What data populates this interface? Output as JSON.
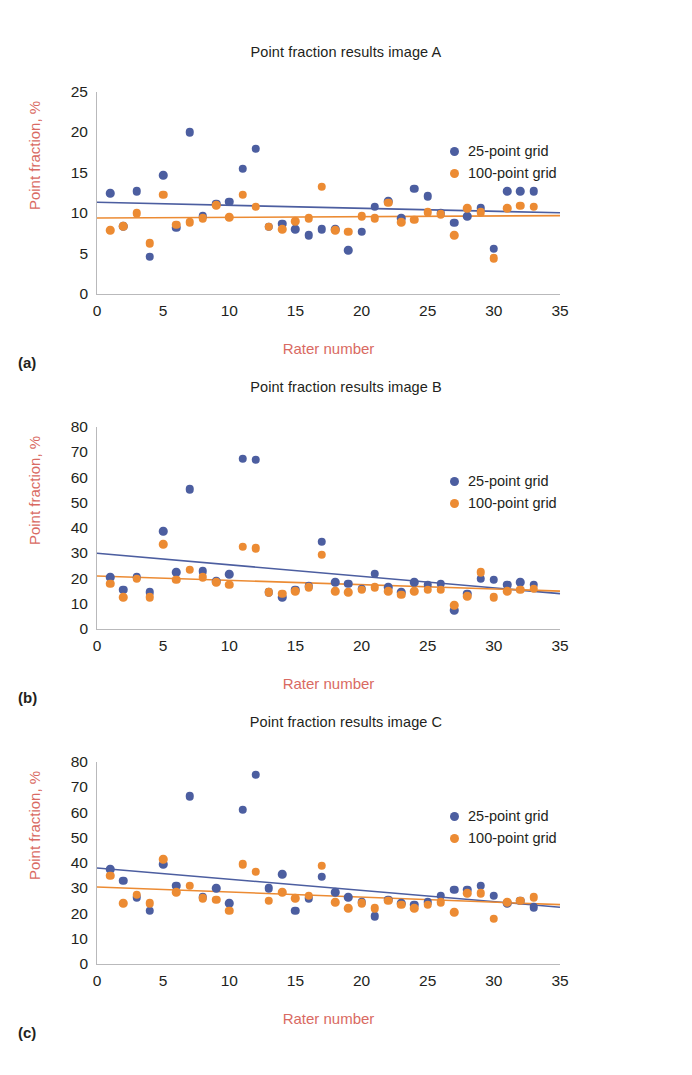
{
  "figure": {
    "colors": {
      "blue": "#4c5ea0",
      "orange": "#ec8b33",
      "axis_label": "#d96a62",
      "axis_line": "#b9b9bb",
      "text": "#231f20"
    },
    "legend": {
      "series1": "25-point grid",
      "series2": "100-point grid"
    },
    "axis": {
      "xlabel": "Rater number",
      "ylabel": "Point fraction, %"
    },
    "panels": [
      {
        "letter": "(a)",
        "title": "Point fraction results image A"
      },
      {
        "letter": "(b)",
        "title": "Point fraction results image B"
      },
      {
        "letter": "(c)",
        "title": "Point fraction results image C"
      }
    ]
  },
  "chart_data": [
    {
      "type": "scatter",
      "panel": "(a)",
      "title": "Point fraction results image A",
      "xlabel": "Rater number",
      "ylabel": "Point fraction, %",
      "xlim": [
        0,
        35
      ],
      "ylim": [
        0,
        25
      ],
      "xticks": [
        0,
        5,
        10,
        15,
        20,
        25,
        30,
        35
      ],
      "yticks": [
        0,
        5,
        10,
        15,
        20,
        25
      ],
      "grid": false,
      "legend_position": "top-right",
      "x": [
        1,
        2,
        3,
        4,
        5,
        6,
        7,
        8,
        9,
        10,
        11,
        12,
        13,
        14,
        15,
        16,
        17,
        18,
        19,
        20,
        21,
        22,
        23,
        24,
        25,
        26,
        27,
        28,
        29,
        30,
        31,
        32,
        33
      ],
      "series": [
        {
          "name": "25-point grid",
          "color": "#4c5ea0",
          "values": [
            12.5,
            8.4,
            12.7,
            4.6,
            14.7,
            8.2,
            20.0,
            9.6,
            11.2,
            11.4,
            15.5,
            18.0,
            8.3,
            8.7,
            8.0,
            7.3,
            8.0,
            8.0,
            5.4,
            7.7,
            10.8,
            11.5,
            9.4,
            13.0,
            12.1,
            10.0,
            8.8,
            9.6,
            10.6,
            5.6,
            12.7,
            12.7,
            12.7
          ],
          "trend": {
            "y_at_x0": 11.35,
            "y_at_x35": 10.05
          }
        },
        {
          "name": "100-point grid",
          "color": "#ec8b33",
          "values": [
            7.9,
            8.4,
            10.0,
            6.3,
            12.3,
            8.6,
            8.9,
            9.4,
            11.0,
            9.5,
            12.3,
            10.8,
            8.3,
            8.0,
            9.0,
            9.4,
            13.3,
            7.9,
            7.7,
            9.6,
            9.4,
            11.3,
            8.9,
            9.2,
            10.1,
            9.9,
            7.3,
            10.6,
            10.1,
            4.4,
            10.6,
            10.9,
            10.8
          ],
          "trend": {
            "y_at_x0": 9.4,
            "y_at_x35": 9.7
          }
        }
      ]
    },
    {
      "type": "scatter",
      "panel": "(b)",
      "title": "Point fraction results image B",
      "xlabel": "Rater number",
      "ylabel": "Point fraction, %",
      "xlim": [
        0,
        35
      ],
      "ylim": [
        0,
        80
      ],
      "xticks": [
        0,
        5,
        10,
        15,
        20,
        25,
        30,
        35
      ],
      "yticks": [
        0,
        10,
        20,
        30,
        40,
        50,
        60,
        70,
        80
      ],
      "grid": false,
      "legend_position": "top-right",
      "x": [
        1,
        2,
        3,
        4,
        5,
        6,
        7,
        8,
        9,
        10,
        11,
        12,
        13,
        14,
        15,
        16,
        17,
        18,
        19,
        20,
        21,
        22,
        23,
        24,
        25,
        26,
        27,
        28,
        29,
        30,
        31,
        32,
        33
      ],
      "series": [
        {
          "name": "25-point grid",
          "color": "#4c5ea0",
          "values": [
            20.5,
            15.5,
            20.5,
            14.5,
            38.8,
            22.5,
            55.4,
            22.8,
            19.0,
            21.6,
            67.5,
            67.0,
            14.5,
            12.5,
            15.5,
            17.0,
            34.5,
            18.5,
            18.0,
            16.0,
            21.8,
            16.5,
            14.5,
            18.5,
            17.5,
            18.0,
            7.5,
            14.0,
            20.0,
            19.5,
            17.5,
            18.5,
            17.5
          ],
          "trend": {
            "y_at_x0": 30.0,
            "y_at_x35": 14.0
          }
        },
        {
          "name": "100-point grid",
          "color": "#ec8b33",
          "values": [
            18.0,
            12.5,
            20.0,
            12.5,
            33.5,
            19.5,
            23.5,
            20.5,
            18.5,
            17.5,
            32.5,
            32.0,
            14.5,
            14.0,
            15.0,
            16.5,
            29.5,
            15.0,
            14.5,
            15.5,
            16.5,
            15.0,
            13.5,
            15.0,
            15.5,
            15.5,
            9.5,
            13.0,
            22.5,
            12.5,
            15.0,
            15.5,
            16.0
          ],
          "trend": {
            "y_at_x0": 21.0,
            "y_at_x35": 15.0
          }
        }
      ]
    },
    {
      "type": "scatter",
      "panel": "(c)",
      "title": "Point fraction results image C",
      "xlabel": "Rater number",
      "ylabel": "Point fraction, %",
      "xlim": [
        0,
        35
      ],
      "ylim": [
        0,
        80
      ],
      "xticks": [
        0,
        5,
        10,
        15,
        20,
        25,
        30,
        35
      ],
      "yticks": [
        0,
        10,
        20,
        30,
        40,
        50,
        60,
        70,
        80
      ],
      "grid": false,
      "legend_position": "top-right",
      "x": [
        1,
        2,
        3,
        4,
        5,
        6,
        7,
        8,
        9,
        10,
        11,
        12,
        13,
        14,
        15,
        16,
        17,
        18,
        19,
        20,
        21,
        22,
        23,
        24,
        25,
        26,
        27,
        28,
        29,
        30,
        31,
        32,
        33
      ],
      "values_note": "scatter",
      "series": [
        {
          "name": "25-point grid",
          "color": "#4c5ea0",
          "values": [
            37.5,
            33.0,
            26.5,
            21.0,
            39.5,
            31.0,
            66.5,
            26.5,
            30.0,
            24.0,
            61.0,
            75.0,
            30.0,
            35.5,
            21.0,
            26.0,
            34.5,
            28.5,
            26.5,
            24.5,
            19.0,
            25.5,
            24.0,
            23.5,
            24.5,
            27.0,
            29.5,
            29.5,
            31.0,
            27.0,
            24.0,
            25.0,
            22.5
          ],
          "trend": {
            "y_at_x0": 38.0,
            "y_at_x35": 22.5
          }
        },
        {
          "name": "100-point grid",
          "color": "#ec8b33",
          "values": [
            35.0,
            24.0,
            27.5,
            24.0,
            41.5,
            28.5,
            31.0,
            26.0,
            25.5,
            21.0,
            39.5,
            36.5,
            25.0,
            28.5,
            26.0,
            27.0,
            39.0,
            24.5,
            22.0,
            24.0,
            22.0,
            25.0,
            23.5,
            22.0,
            23.5,
            24.5,
            20.5,
            28.0,
            28.0,
            18.0,
            24.5,
            25.0,
            26.5
          ],
          "trend": {
            "y_at_x0": 30.5,
            "y_at_x35": 23.5
          }
        }
      ]
    }
  ]
}
